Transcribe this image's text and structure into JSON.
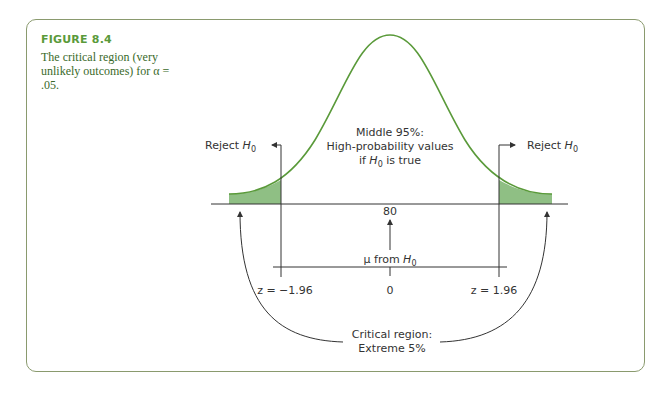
{
  "figure": {
    "title": "FIGURE 8.4",
    "description": "The critical region (very unlikely outcomes) for α = .05."
  },
  "diagram": {
    "reject_left": "Reject ",
    "reject_right": "Reject ",
    "h0_H": "H",
    "h0_sub": "0",
    "middle_line1": "Middle 95%:",
    "middle_line2": "High-probability values",
    "middle_line3_pre": "if ",
    "middle_line3_post": " is true",
    "mean_value": "80",
    "mu_label": "μ from ",
    "z_left": "z = −1.96",
    "z_zero": "0",
    "z_right": "z = 1.96",
    "critical_line1": "Critical region:",
    "critical_line2": "Extreme 5%"
  },
  "colors": {
    "curve": "#5a9a3a",
    "tail_fill": "#8fbf84",
    "frame": "#8a9a6e",
    "title": "#5a9a3a"
  }
}
